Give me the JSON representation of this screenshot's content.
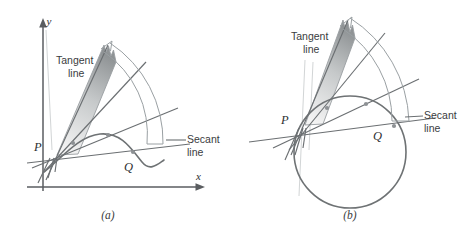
{
  "figure": {
    "background_color": "#ffffff",
    "line_color": "#6b6f72",
    "curve_color": "#6e7274",
    "arc_color": "#9aa0a3",
    "wedge_fill_top": "#9b9ea0",
    "wedge_fill_bottom": "#f2f2f2",
    "text_color": "#2d2f31"
  },
  "panels": [
    {
      "id": "a",
      "caption": "(a)",
      "kind": "curve",
      "axes": {
        "x_label": "x",
        "y_label": "y",
        "show": true
      },
      "points": [
        {
          "name": "P",
          "label": "P"
        },
        {
          "name": "Q",
          "label": "Q"
        }
      ],
      "annotations": [
        {
          "name": "tangent-line",
          "line1": "Tangent",
          "line2": "line"
        },
        {
          "name": "secant-line",
          "line1": "Secant",
          "line2": "line"
        }
      ],
      "secant_count": 3
    },
    {
      "id": "b",
      "caption": "(b)",
      "kind": "circle",
      "axes": {
        "x_label": "",
        "y_label": "",
        "show": false
      },
      "points": [
        {
          "name": "P",
          "label": "P"
        },
        {
          "name": "Q",
          "label": "Q"
        }
      ],
      "annotations": [
        {
          "name": "tangent-line",
          "line1": "Tangent",
          "line2": "line"
        },
        {
          "name": "secant-line",
          "line1": "Secant",
          "line2": "line"
        }
      ],
      "secant_count": 3
    }
  ]
}
